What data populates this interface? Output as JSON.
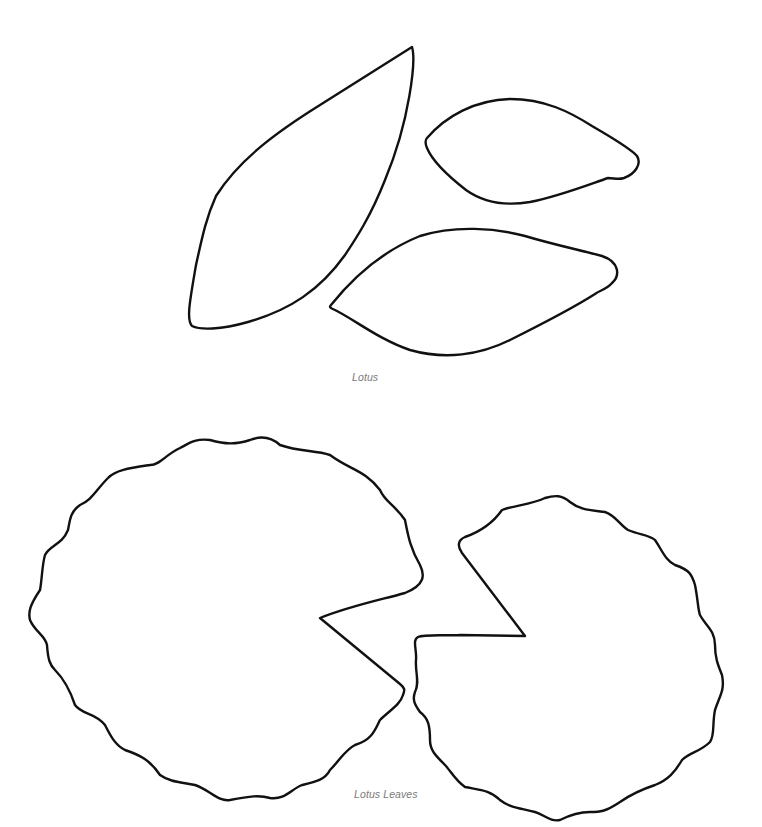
{
  "page": {
    "background": "#ffffff",
    "outline_color": "#111111",
    "caption_color": "#7a7a7a"
  },
  "sections": [
    {
      "id": "lotus",
      "caption": "Lotus",
      "shapes": [
        {
          "name": "large-petal"
        },
        {
          "name": "small-petal"
        },
        {
          "name": "medium-petal"
        }
      ]
    },
    {
      "id": "lotus-leaves",
      "caption": "Lotus Leaves",
      "shapes": [
        {
          "name": "left-lily-pad"
        },
        {
          "name": "right-lily-pad"
        }
      ]
    }
  ]
}
